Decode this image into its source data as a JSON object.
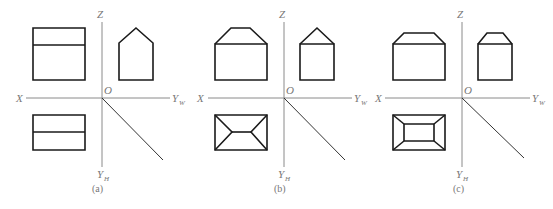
{
  "figure": {
    "panels": [
      {
        "id": "a",
        "caption": "(a)",
        "origin": [
          102,
          98
        ],
        "axis": {
          "x_left": 26,
          "x_right": 170,
          "z_top": 22,
          "yh_bottom": 167,
          "diag_end": [
            163,
            160
          ]
        },
        "labels": {
          "x": "X",
          "z": "Z",
          "o": "O",
          "yw": "Y",
          "yw_sub": "W",
          "yh": "Y",
          "yh_sub": "H"
        },
        "label_pos": {
          "x": [
            16,
            102
          ],
          "z": [
            97,
            18
          ],
          "o": [
            104,
            94
          ],
          "yw": [
            172,
            102
          ],
          "yh": [
            97,
            178
          ],
          "caption": [
            92,
            192
          ]
        },
        "front_view": [
          "M33,28 L85,28 L85,80 L33,80 Z",
          "M33,45 L85,45"
        ],
        "side_view": [
          "M136,28 L153,43 L153,80 L119,80 L119,43 Z"
        ],
        "top_view": [
          "M33,115 L85,115 L85,150 L33,150 Z",
          "M33,132 L85,132"
        ]
      },
      {
        "id": "b",
        "caption": "(b)",
        "origin": [
          284,
          98
        ],
        "axis": {
          "x_left": 208,
          "x_right": 352,
          "z_top": 22,
          "yh_bottom": 167,
          "diag_end": [
            345,
            160
          ]
        },
        "labels": {
          "x": "X",
          "z": "Z",
          "o": "O",
          "yw": "Y",
          "yw_sub": "W",
          "yh": "Y",
          "yh_sub": "H"
        },
        "label_pos": {
          "x": [
            197,
            102
          ],
          "z": [
            279,
            18
          ],
          "o": [
            286,
            94
          ],
          "yw": [
            354,
            102
          ],
          "yh": [
            278,
            178
          ],
          "caption": [
            274,
            192
          ]
        },
        "front_view": [
          "M215,44 L267,44 L267,80 L215,80 Z",
          "M215,44 L231,28 L250,28 L267,44"
        ],
        "side_view": [
          "M300,44 L334,44 L334,80 L300,80 Z",
          "M300,44 L317,28 L334,44"
        ],
        "top_view": [
          "M215,115 L267,115 L267,150 L215,150 Z",
          "M232,132 L251,132",
          "M215,115 L232,132 L215,150",
          "M267,115 L251,132 L267,150"
        ]
      },
      {
        "id": "c",
        "caption": "(c)",
        "origin": [
          462,
          98
        ],
        "axis": {
          "x_left": 385,
          "x_right": 530,
          "z_top": 22,
          "yh_bottom": 167,
          "diag_end": [
            524,
            158
          ]
        },
        "labels": {
          "x": "X",
          "z": "Z",
          "o": "O",
          "yw": "Y",
          "yw_sub": "W",
          "yh": "Y",
          "yh_sub": "H"
        },
        "label_pos": {
          "x": [
            375,
            102
          ],
          "z": [
            457,
            18
          ],
          "o": [
            464,
            94
          ],
          "yw": [
            532,
            102
          ],
          "yh": [
            456,
            178
          ],
          "caption": [
            453,
            192
          ]
        },
        "front_view": [
          "M393,44 L445,44 L445,80 L393,80 Z",
          "M393,44 L404,33 L434,33 L445,44"
        ],
        "side_view": [
          "M478,44 L512,44 L512,80 L478,80 Z",
          "M478,44 L487,33 L503,33 L512,44"
        ],
        "top_view": [
          "M393,115 L445,115 L445,150 L393,150 Z",
          "M404,124 L434,124 L434,141 L404,141 Z",
          "M393,115 L404,124",
          "M445,115 L434,124",
          "M393,150 L404,141",
          "M445,150 L434,141"
        ]
      }
    ],
    "colors": {
      "outline": "#1a1a1a",
      "axis": "#8a8a8a",
      "label": "#777777",
      "background": "#ffffff"
    }
  }
}
